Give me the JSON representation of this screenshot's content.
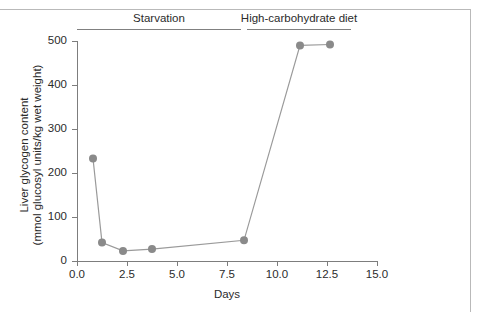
{
  "chart_data": {
    "type": "line",
    "title": "",
    "xlabel": "Days",
    "ylabel": "Liver glycogen content (mmol glucosyl units/kg wet weight)",
    "ylabel_line1": "Liver glycogen content",
    "ylabel_line2": "(mmol glucosyl units/kg wet weight)",
    "xlim": [
      0.0,
      15.0
    ],
    "ylim": [
      0,
      500
    ],
    "xticks": [
      0.0,
      2.5,
      5.0,
      7.5,
      10.0,
      12.5,
      15.0
    ],
    "xtick_labels": [
      "0.0",
      "2.5",
      "5.0",
      "7.5",
      "10.0",
      "12.5",
      "15.0"
    ],
    "yticks": [
      0,
      100,
      200,
      300,
      400,
      500
    ],
    "ytick_labels": [
      "0",
      "100",
      "200",
      "300",
      "400",
      "500"
    ],
    "grid": false,
    "legend": "none",
    "marker": "circle",
    "marker_color": "#8a8a8a",
    "line_color": "#9a9a9a",
    "series": [
      {
        "name": "Liver glycogen",
        "x": [
          0.8,
          1.25,
          2.3,
          3.75,
          8.35,
          11.15,
          12.65
        ],
        "y": [
          233,
          42,
          23,
          27,
          47,
          490,
          492
        ]
      }
    ],
    "annotations": [
      {
        "label": "Starvation",
        "x_start": 0.0,
        "x_end": 8.2,
        "label_x": 4.1
      },
      {
        "label": "High-carbohydrate diet",
        "x_start": 8.5,
        "x_end": 13.7,
        "label_x": 11.1
      }
    ]
  },
  "colors": {
    "marker": "#8a8a8a",
    "line": "#9a9a9a",
    "axis": "#7d7d7d",
    "text": "#2b2b2b",
    "frame": "#b9b9b9",
    "background": "#ffffff"
  }
}
